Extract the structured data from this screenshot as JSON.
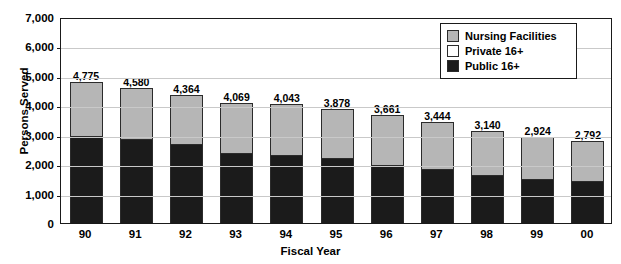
{
  "chart_data": {
    "type": "bar",
    "subtype": "stacked-bar",
    "title": "",
    "xlabel": "Fiscal Year",
    "ylabel": "Persons Served",
    "categories": [
      "90",
      "91",
      "92",
      "93",
      "94",
      "95",
      "96",
      "97",
      "98",
      "99",
      "00"
    ],
    "ylim": [
      0,
      7000
    ],
    "ytick_values": [
      0,
      1000,
      2000,
      3000,
      4000,
      5000,
      6000,
      7000
    ],
    "ytick_labels": [
      "0",
      "1,000",
      "2,000",
      "3,000",
      "4,000",
      "5,000",
      "6,000",
      "7,000"
    ],
    "grid": true,
    "grid_axis": "y",
    "legend_position": "top-right",
    "series": [
      {
        "name": "Public 16+",
        "color": "#1b1b1b",
        "values": [
          2950,
          2840,
          2690,
          2390,
          2310,
          2210,
          1975,
          1840,
          1640,
          1500,
          1420
        ]
      },
      {
        "name": "Private 16+",
        "color": "#ffffff",
        "values": [
          0,
          0,
          0,
          0,
          0,
          0,
          0,
          0,
          0,
          0,
          0
        ]
      },
      {
        "name": "Nursing Facilities",
        "color": "#b6b6b6",
        "values": [
          1825,
          1740,
          1674,
          1679,
          1733,
          1668,
          1686,
          1604,
          1500,
          1424,
          1372
        ]
      }
    ],
    "totals": [
      4775,
      4580,
      4364,
      4069,
      4043,
      3878,
      3661,
      3444,
      3140,
      2924,
      2792
    ],
    "total_labels": [
      "4,775",
      "4,580",
      "4,364",
      "4,069",
      "4,043",
      "3,878",
      "3,661",
      "3,444",
      "3,140",
      "2,924",
      "2,792"
    ]
  },
  "legend": {
    "items": [
      {
        "label": "Nursing Facilities",
        "swatch": "nursing"
      },
      {
        "label": "Private 16+",
        "swatch": "private"
      },
      {
        "label": "Public 16+",
        "swatch": "public"
      }
    ]
  },
  "cropped_title": ""
}
